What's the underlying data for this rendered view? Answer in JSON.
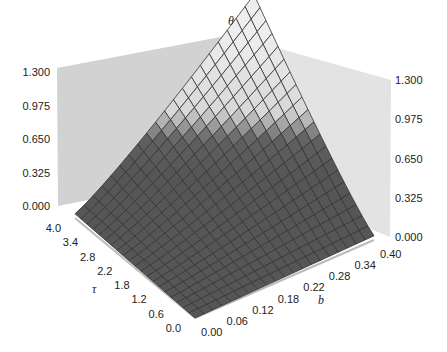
{
  "chart_data": {
    "type": "surface3d",
    "title": "",
    "zlabel": "θ",
    "xlabel": "b",
    "ylabel": "τ",
    "z_ticks": [
      "0.000",
      "0.325",
      "0.650",
      "0.975",
      "1.300"
    ],
    "x_ticks": [
      "0.00",
      "0.06",
      "0.12",
      "0.18",
      "0.22",
      "0.28",
      "0.34",
      "0.40"
    ],
    "y_ticks": [
      "0.0",
      "0.6",
      "1.2",
      "1.8",
      "2.2",
      "2.8",
      "3.4",
      "4.0"
    ],
    "xlim": [
      0,
      0.4
    ],
    "ylim": [
      0,
      4.0
    ],
    "zlim": [
      0,
      1.3
    ],
    "grid_resolution": 21,
    "surface_description": "θ increases with both b and τ; near 0 at b=0,τ=0 and reaches ~1.3 at b=0.40, τ=4.0",
    "corner_values": {
      "b0_tau0": 0.0,
      "b040_tau0": 0.05,
      "b0_tau4": 0.05,
      "b040_tau4": 1.3
    },
    "colors": {
      "surface_low": "#5a5a5a",
      "surface_high": "#e8e8e8",
      "mesh": "#333333",
      "walls": "#d4d4d4",
      "wall_right": "#e2e2e2"
    }
  }
}
